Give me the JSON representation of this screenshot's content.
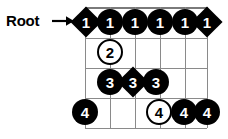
{
  "label": {
    "root_text": "Root",
    "arrow_icon": "right-arrow-icon"
  },
  "fretboard": {
    "strings": 6,
    "frets": 4,
    "orientation": "horizontal",
    "grid_color": "#8a8a8a",
    "marker_fill_color": "#000000",
    "marker_open_color": "#ffffff",
    "columns_x": [
      85,
      110,
      135,
      160,
      185,
      207
    ],
    "rows_y": [
      7,
      38,
      68,
      98,
      128
    ]
  },
  "markers": [
    {
      "id": "m1",
      "finger": "1",
      "shape": "diamond",
      "fill": "filled",
      "row": 0,
      "col": 0,
      "x": 73,
      "y": 9
    },
    {
      "id": "m2",
      "finger": "1",
      "shape": "circle",
      "fill": "filled",
      "row": 0,
      "col": 1,
      "x": 97,
      "y": 9
    },
    {
      "id": "m3",
      "finger": "1",
      "shape": "circle",
      "fill": "filled",
      "row": 0,
      "col": 2,
      "x": 122,
      "y": 9
    },
    {
      "id": "m4",
      "finger": "1",
      "shape": "circle",
      "fill": "filled",
      "row": 0,
      "col": 3,
      "x": 147,
      "y": 9
    },
    {
      "id": "m5",
      "finger": "1",
      "shape": "circle",
      "fill": "filled",
      "row": 0,
      "col": 4,
      "x": 172,
      "y": 9
    },
    {
      "id": "m6",
      "finger": "1",
      "shape": "diamond",
      "fill": "filled",
      "row": 0,
      "col": 5,
      "x": 194,
      "y": 9
    },
    {
      "id": "m7",
      "finger": "2",
      "shape": "circle",
      "fill": "open",
      "row": 1,
      "col": 1,
      "x": 97,
      "y": 39
    },
    {
      "id": "m8",
      "finger": "3",
      "shape": "circle",
      "fill": "filled",
      "row": 2,
      "col": 1,
      "x": 97,
      "y": 69
    },
    {
      "id": "m9",
      "finger": "3",
      "shape": "diamond",
      "fill": "filled",
      "row": 2,
      "col": 2,
      "x": 120,
      "y": 69
    },
    {
      "id": "m10",
      "finger": "3",
      "shape": "circle",
      "fill": "filled",
      "row": 2,
      "col": 3,
      "x": 143,
      "y": 69
    },
    {
      "id": "m11",
      "finger": "4",
      "shape": "circle",
      "fill": "filled",
      "row": 3,
      "col": 0,
      "x": 72,
      "y": 99
    },
    {
      "id": "m12",
      "finger": "4",
      "shape": "circle",
      "fill": "open",
      "row": 3,
      "col": 3,
      "x": 146,
      "y": 99
    },
    {
      "id": "m13",
      "finger": "4",
      "shape": "circle",
      "fill": "filled",
      "row": 3,
      "col": 4,
      "x": 171,
      "y": 99
    },
    {
      "id": "m14",
      "finger": "4",
      "shape": "circle",
      "fill": "filled",
      "row": 3,
      "col": 5,
      "x": 194,
      "y": 99
    }
  ]
}
